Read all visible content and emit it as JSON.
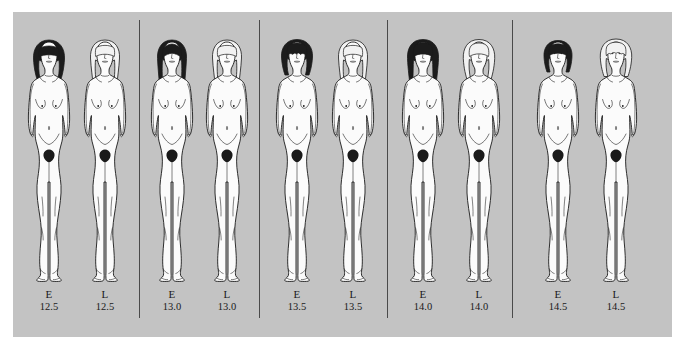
{
  "figure": {
    "background_color": "#c3c3c3",
    "page_color": "#ffffff",
    "line_color": "#1a1a1a",
    "dark_hair_color": "#1c1c1c",
    "light_hair_color": "#f2f2f2",
    "skin_color": "#fbfbfb"
  },
  "panels": [
    {
      "id": "panel-12-5",
      "left": 14,
      "width": 125,
      "subjects": [
        {
          "stage": "E",
          "age": "12.5",
          "hair": "dark",
          "hair_style": "bob-fringe",
          "slot_left": 6
        },
        {
          "stage": "L",
          "age": "12.5",
          "hair": "light",
          "hair_style": "long-straight",
          "slot_left": 62
        }
      ]
    },
    {
      "id": "panel-13-0",
      "left": 140,
      "width": 119,
      "subjects": [
        {
          "stage": "E",
          "age": "13.0",
          "hair": "dark",
          "hair_style": "long-parted",
          "slot_left": 3
        },
        {
          "stage": "L",
          "age": "13.0",
          "hair": "light",
          "hair_style": "long-straight",
          "slot_left": 58
        }
      ]
    },
    {
      "id": "panel-13-5",
      "left": 260,
      "width": 127,
      "subjects": [
        {
          "stage": "E",
          "age": "13.5",
          "hair": "dark",
          "hair_style": "short-curly-fringe",
          "slot_left": 8
        },
        {
          "stage": "L",
          "age": "13.5",
          "hair": "light",
          "hair_style": "long-straight",
          "slot_left": 64
        }
      ]
    },
    {
      "id": "panel-14-0",
      "left": 388,
      "width": 124,
      "subjects": [
        {
          "stage": "E",
          "age": "14.0",
          "hair": "dark",
          "hair_style": "long-wavy",
          "slot_left": 6
        },
        {
          "stage": "L",
          "age": "14.0",
          "hair": "light",
          "hair_style": "bob",
          "slot_left": 62
        }
      ]
    },
    {
      "id": "panel-14-5",
      "left": 513,
      "width": 145,
      "subjects": [
        {
          "stage": "E",
          "age": "14.5",
          "hair": "dark",
          "hair_style": "short-fringe",
          "slot_left": 16
        },
        {
          "stage": "L",
          "age": "14.5",
          "hair": "light",
          "hair_style": "short-curly",
          "slot_left": 74
        }
      ]
    }
  ],
  "separators": [
    139,
    259,
    387,
    512
  ]
}
